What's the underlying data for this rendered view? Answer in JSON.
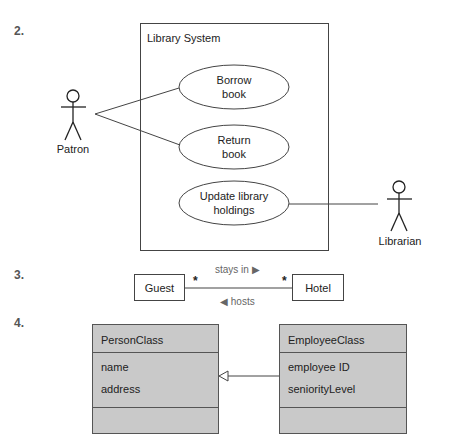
{
  "sections": {
    "s2": {
      "number": "2."
    },
    "s3": {
      "number": "3."
    },
    "s4": {
      "number": "4."
    }
  },
  "use_case": {
    "system_label": "Library System",
    "actors": [
      {
        "name": "Patron"
      },
      {
        "name": "Librarian"
      }
    ],
    "use_cases": [
      {
        "line1": "Borrow",
        "line2": "book"
      },
      {
        "line1": "Return",
        "line2": "book"
      },
      {
        "line1": "Update library",
        "line2": "holdings"
      }
    ]
  },
  "association": {
    "left_class": "Guest",
    "right_class": "Hotel",
    "left_multiplicity": "*",
    "right_multiplicity": "*",
    "top_label": "stays in ▶",
    "bottom_label": "◀ hosts"
  },
  "generalization": {
    "parent": {
      "name": "PersonClass",
      "attributes": [
        "name",
        "address"
      ]
    },
    "child": {
      "name": "EmployeeClass",
      "attributes": [
        "employee ID",
        "seniorityLevel"
      ]
    }
  }
}
